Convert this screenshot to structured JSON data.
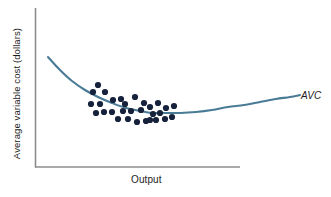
{
  "figure": {
    "background": "#ffffff",
    "axis_color": "#8c8c8c",
    "curve_color": "#4a7b96",
    "point_color": "#16213c"
  },
  "labels": {
    "ylabel": "Average variable cost (dollars)",
    "xlabel": "Output",
    "curve_label": "AVC"
  },
  "chart_data": {
    "type": "scatter",
    "title": "",
    "xlabel": "Output",
    "ylabel": "Average variable cost (dollars)",
    "grid": false,
    "legend_position": "inline-right",
    "axis": {
      "x_start_px": 35,
      "x_end_px": 240,
      "y_px": 167,
      "y_top_px": 8,
      "y_bottom_px": 167,
      "x_px": 35,
      "ticks": [],
      "tick_labels": [],
      "xlim_note": "unlabeled axes, qualitative figure",
      "ylim_note": "unlabeled axes, qualitative figure"
    },
    "series": [
      {
        "name": "AVC",
        "type": "line",
        "color": "#4a7b96",
        "label": "AVC",
        "label_style": "italic",
        "label_pos_px": [
          301,
          97
        ],
        "description": "U-shaped average variable cost curve, falling steeply then flattening to a minimum and rising gradually",
        "path_px": [
          [
            48,
            57
          ],
          [
            60,
            70
          ],
          [
            72,
            81
          ],
          [
            85,
            90
          ],
          [
            98,
            97
          ],
          [
            112,
            103
          ],
          [
            126,
            108
          ],
          [
            140,
            111
          ],
          [
            152,
            113
          ],
          [
            166,
            113
          ],
          [
            180,
            113
          ],
          [
            196,
            112
          ],
          [
            212,
            110
          ],
          [
            228,
            107
          ],
          [
            244,
            105
          ],
          [
            260,
            102
          ],
          [
            276,
            99
          ],
          [
            290,
            97
          ],
          [
            300,
            95
          ]
        ]
      },
      {
        "name": "observations",
        "type": "scatter",
        "color": "#16213c",
        "marker": "circle",
        "marker_radius_px": 3.1,
        "count": 30,
        "points_px": [
          [
            98,
            85
          ],
          [
            93,
            92
          ],
          [
            105,
            92
          ],
          [
            91,
            104
          ],
          [
            100,
            104
          ],
          [
            113,
            100
          ],
          [
            121,
            99
          ],
          [
            125,
            104
          ],
          [
            135,
            97
          ],
          [
            104,
            112
          ],
          [
            112,
            112
          ],
          [
            123,
            111
          ],
          [
            131,
            111
          ],
          [
            141,
            110
          ],
          [
            150,
            107
          ],
          [
            144,
            103
          ],
          [
            153,
            114
          ],
          [
            96,
            113
          ],
          [
            118,
            119
          ],
          [
            128,
            119
          ],
          [
            137,
            122
          ],
          [
            146,
            121
          ],
          [
            156,
            120
          ],
          [
            160,
            113
          ],
          [
            166,
            108
          ],
          [
            165,
            119
          ],
          [
            172,
            117
          ],
          [
            158,
            103
          ],
          [
            174,
            106
          ],
          [
            150,
            120
          ]
        ]
      }
    ]
  }
}
